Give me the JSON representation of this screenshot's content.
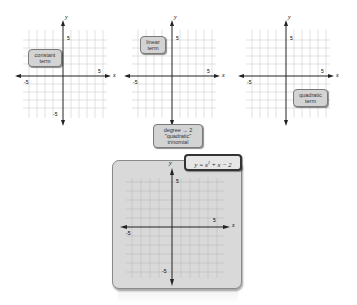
{
  "graphs": [
    {
      "id": "constant",
      "callout": {
        "line1": "constant",
        "line2": "term"
      },
      "labels": {
        "y": "y",
        "x": "x",
        "y_max": "5",
        "y_min": "-5",
        "x_min": "-5",
        "x_max": "5"
      }
    },
    {
      "id": "linear",
      "callout": {
        "line1": "linear",
        "line2": "term"
      },
      "labels": {
        "y": "y",
        "x": "x",
        "y_max": "5",
        "y_min": "-5",
        "x_min": "-5",
        "x_max": "5"
      }
    },
    {
      "id": "quadratic",
      "callout": {
        "line1": "quadratic",
        "line2": "term"
      },
      "labels": {
        "y": "y",
        "x": "x",
        "y_max": "5",
        "y_min": "-5",
        "x_min": "-5",
        "x_max": "5"
      }
    }
  ],
  "degree_callout": {
    "line1": "degree → 2",
    "line2": "\"quadratic\"",
    "line3": "trinomial"
  },
  "equation": {
    "lhs": "y = x",
    "exp": "2",
    "rhs": " + x − 2"
  },
  "result_graph": {
    "labels": {
      "y": "y",
      "x": "x",
      "y_max": "5",
      "y_min": "-5",
      "x_min": "-5",
      "x_max": "5"
    }
  },
  "colors": {
    "grid": "#c8c8c8",
    "axis": "#222222",
    "panel": "#d9d9d9",
    "callout": "#d3d3d3"
  }
}
